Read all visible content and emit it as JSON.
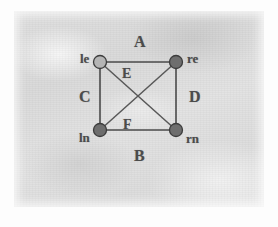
{
  "figure": {
    "kind": "undirected-graph-diagram",
    "medium": "scanned-photocopy",
    "background_color": "#dcdcdc",
    "ink_color": "#4a4a4a"
  },
  "nodes": [
    {
      "id": "le",
      "label": "le",
      "position": "top-left",
      "fill": "#b5b5b5",
      "style": "light",
      "x": 100,
      "y": 62
    },
    {
      "id": "re",
      "label": "re",
      "position": "top-right",
      "fill": "#6e6e6e",
      "style": "dark",
      "x": 176,
      "y": 62
    },
    {
      "id": "ln",
      "label": "ln",
      "position": "bottom-left",
      "fill": "#6e6e6e",
      "style": "dark",
      "x": 100,
      "y": 130
    },
    {
      "id": "rn",
      "label": "rn",
      "position": "bottom-right",
      "fill": "#6e6e6e",
      "style": "dark",
      "x": 176,
      "y": 130
    }
  ],
  "edges": [
    {
      "id": "A",
      "label": "A",
      "from": "le",
      "to": "re",
      "kind": "side",
      "side": "top"
    },
    {
      "id": "B",
      "label": "B",
      "from": "ln",
      "to": "rn",
      "kind": "side",
      "side": "bottom"
    },
    {
      "id": "C",
      "label": "C",
      "from": "le",
      "to": "ln",
      "kind": "side",
      "side": "left"
    },
    {
      "id": "D",
      "label": "D",
      "from": "re",
      "to": "rn",
      "kind": "side",
      "side": "right"
    },
    {
      "id": "E",
      "label": "E",
      "from": "le",
      "to": "rn",
      "kind": "diagonal"
    },
    {
      "id": "F",
      "label": "F",
      "from": "ln",
      "to": "re",
      "kind": "diagonal"
    }
  ],
  "labels": {
    "node_le": "le",
    "node_re": "re",
    "node_ln": "ln",
    "node_rn": "rn",
    "edge_a": "A",
    "edge_b": "B",
    "edge_c": "C",
    "edge_d": "D",
    "edge_e": "E",
    "edge_f": "F"
  }
}
